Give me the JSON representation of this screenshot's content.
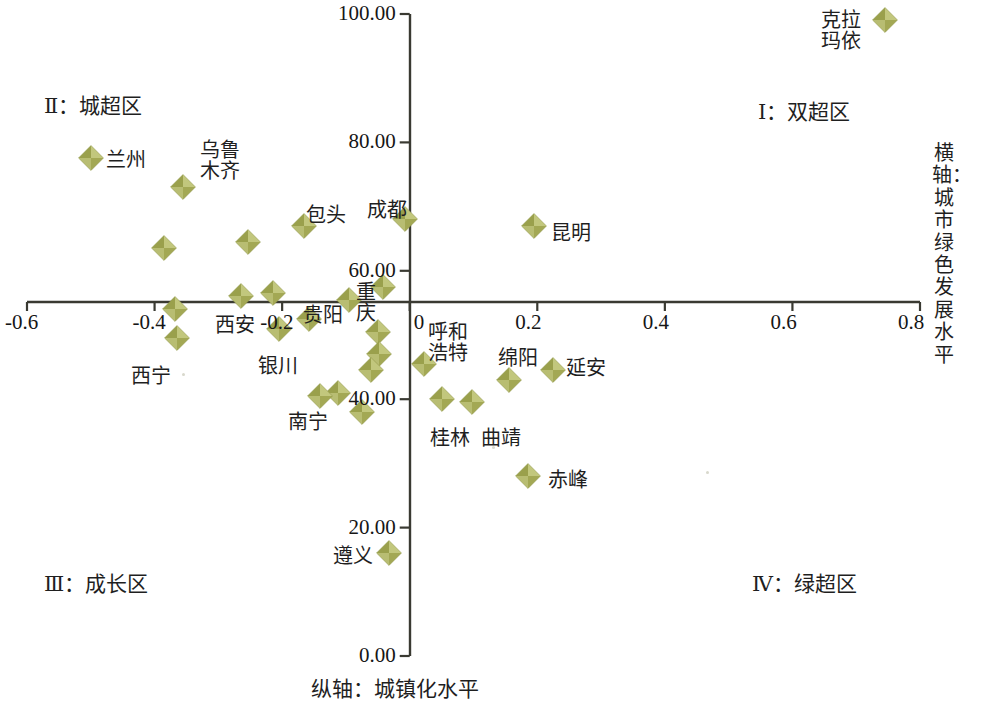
{
  "chart_data": {
    "type": "scatter",
    "title": "",
    "xlabel": "横轴：城市绿色发展水平",
    "ylabel": "纵轴：城镇化水平",
    "xlim": [
      -0.6,
      0.8
    ],
    "ylim": [
      0.0,
      100.0
    ],
    "xticks": [
      "-0.6",
      "-0.4",
      "-0.2",
      "0",
      "0.2",
      "0.4",
      "0.6",
      "0.8"
    ],
    "xtick_values": [
      -0.6,
      -0.4,
      -0.2,
      0,
      0.2,
      0.4,
      0.6,
      0.8
    ],
    "yticks": [
      "0.00",
      "20.00",
      "40.00",
      "60.00",
      "80.00",
      "100.00"
    ],
    "ytick_values": [
      0,
      20,
      40,
      60,
      80,
      100
    ],
    "grid": false,
    "legend": "none",
    "marker_color": "#a8ad5e",
    "marker_shape": "diamond",
    "axis_color": "#3a3a32",
    "quadrant_labels": [
      {
        "key": "I",
        "text": "Ⅰ：双超区",
        "x_px": 758,
        "y_px": 95
      },
      {
        "key": "II",
        "text": "Ⅱ：城超区",
        "x_px": 44,
        "y_px": 89
      },
      {
        "key": "III",
        "text": "Ⅲ：成长区",
        "x_px": 44,
        "y_px": 567
      },
      {
        "key": "IV",
        "text": "Ⅳ：绿超区",
        "x_px": 752,
        "y_px": 567
      }
    ],
    "points": [
      {
        "name": "克拉玛依",
        "x": 0.745,
        "y": 99.0,
        "label_x_px": 821,
        "label_y_px": 10,
        "label_lines": [
          "克拉",
          "玛依"
        ]
      },
      {
        "name": "兰州",
        "x": -0.5,
        "y": 77.5,
        "label_x_px": 106,
        "label_y_px": 150,
        "label_lines": [
          "兰州"
        ]
      },
      {
        "name": "乌鲁木齐",
        "x": -0.355,
        "y": 73.0,
        "label_x_px": 200,
        "label_y_px": 140,
        "label_lines": [
          "乌鲁",
          "木齐"
        ]
      },
      {
        "name": "包头",
        "x": -0.165,
        "y": 67.0,
        "label_x_px": 306,
        "label_y_px": 205,
        "label_lines": [
          "包头"
        ]
      },
      {
        "name": "成都",
        "x": -0.008,
        "y": 68.0,
        "label_x_px": 367,
        "label_y_px": 200,
        "label_lines": [
          "成都"
        ]
      },
      {
        "name": "昆明",
        "x": 0.195,
        "y": 67.0,
        "label_x_px": 551,
        "label_y_px": 223,
        "label_lines": [
          "昆明"
        ]
      },
      {
        "name": "",
        "x": -0.385,
        "y": 63.5,
        "label_x_px": null,
        "label_y_px": null,
        "label_lines": []
      },
      {
        "name": "",
        "x": -0.253,
        "y": 64.5,
        "label_x_px": null,
        "label_y_px": null,
        "label_lines": []
      },
      {
        "name": "重庆",
        "x": -0.042,
        "y": 57.5,
        "label_x_px": 356,
        "label_y_px": 282,
        "label_lines": [
          "重",
          "庆"
        ]
      },
      {
        "name": "贵阳",
        "x": -0.095,
        "y": 55.5,
        "label_x_px": 303,
        "label_y_px": 305,
        "label_lines": [
          "贵阳"
        ]
      },
      {
        "name": "西安",
        "x": -0.215,
        "y": 56.5,
        "label_x_px": 215,
        "label_y_px": 315,
        "label_lines": [
          "西安"
        ]
      },
      {
        "name": "",
        "x": -0.265,
        "y": 56.0,
        "label_x_px": null,
        "label_y_px": null,
        "label_lines": []
      },
      {
        "name": "",
        "x": -0.368,
        "y": 54.0,
        "label_x_px": null,
        "label_y_px": null,
        "label_lines": []
      },
      {
        "name": "西宁",
        "x": -0.365,
        "y": 49.5,
        "label_x_px": 131,
        "label_y_px": 366,
        "label_lines": [
          "西宁"
        ]
      },
      {
        "name": "银川",
        "x": -0.205,
        "y": 51.0,
        "label_x_px": 258,
        "label_y_px": 356,
        "label_lines": [
          "银川"
        ]
      },
      {
        "name": "",
        "x": -0.158,
        "y": 52.5,
        "label_x_px": null,
        "label_y_px": null,
        "label_lines": []
      },
      {
        "name": "",
        "x": -0.05,
        "y": 50.5,
        "label_x_px": null,
        "label_y_px": null,
        "label_lines": []
      },
      {
        "name": "",
        "x": -0.048,
        "y": 47.0,
        "label_x_px": null,
        "label_y_px": null,
        "label_lines": []
      },
      {
        "name": "",
        "x": -0.06,
        "y": 44.5,
        "label_x_px": null,
        "label_y_px": null,
        "label_lines": []
      },
      {
        "name": "南宁",
        "x": -0.112,
        "y": 41.0,
        "label_x_px": 288,
        "label_y_px": 412,
        "label_lines": [
          "南宁"
        ]
      },
      {
        "name": "",
        "x": -0.14,
        "y": 40.5,
        "label_x_px": null,
        "label_y_px": null,
        "label_lines": []
      },
      {
        "name": "",
        "x": -0.075,
        "y": 38.0,
        "label_x_px": null,
        "label_y_px": null,
        "label_lines": []
      },
      {
        "name": "呼和浩特",
        "x": 0.022,
        "y": 45.5,
        "label_x_px": 428,
        "label_y_px": 322,
        "label_lines": [
          "呼和",
          "浩特"
        ]
      },
      {
        "name": "绵阳",
        "x": 0.155,
        "y": 43.0,
        "label_x_px": 498,
        "label_y_px": 348,
        "label_lines": [
          "绵阳"
        ]
      },
      {
        "name": "延安",
        "x": 0.225,
        "y": 44.5,
        "label_x_px": 566,
        "label_y_px": 358,
        "label_lines": [
          "延安"
        ]
      },
      {
        "name": "桂林",
        "x": 0.05,
        "y": 40.0,
        "label_x_px": 430,
        "label_y_px": 428,
        "label_lines": [
          "桂林"
        ]
      },
      {
        "name": "曲靖",
        "x": 0.097,
        "y": 39.5,
        "label_x_px": 481,
        "label_y_px": 428,
        "label_lines": [
          "曲靖"
        ]
      },
      {
        "name": "赤峰",
        "x": 0.185,
        "y": 28.0,
        "label_x_px": 548,
        "label_y_px": 470,
        "label_lines": [
          "赤峰"
        ]
      },
      {
        "name": "遵义",
        "x": -0.032,
        "y": 16.0,
        "label_x_px": 333,
        "label_y_px": 546,
        "label_lines": [
          "遵义"
        ]
      }
    ]
  },
  "axes": {
    "x_axis_title": "横轴：城市绿色发展水平",
    "y_axis_title": "纵轴：城镇化水平"
  }
}
